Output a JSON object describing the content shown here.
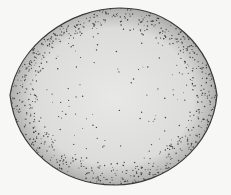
{
  "figure": {
    "colors": {
      "background": "#f7f7f5",
      "fill": "#e6e6e4",
      "outline": "#3a3a3a",
      "stipple": "#444444"
    }
  }
}
